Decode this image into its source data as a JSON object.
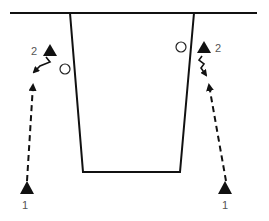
{
  "diagram": {
    "type": "basketball-play-diagram",
    "colors": {
      "line": "#111111",
      "label": "#555555",
      "background": "#ffffff"
    },
    "court": {
      "baseline": {
        "x1": 10,
        "y1": 13,
        "x2": 257,
        "y2": 13
      },
      "lane": {
        "top_left": [
          70,
          13
        ],
        "bottom_left": [
          83,
          172
        ],
        "bottom_right": [
          180,
          172
        ],
        "top_right": [
          194,
          13
        ]
      }
    },
    "players": [
      {
        "id": "left-1",
        "label": "1",
        "marker": "triangle",
        "x": 27,
        "y": 188,
        "label_x": 25,
        "label_y": 208
      },
      {
        "id": "left-2",
        "label": "2",
        "marker": "triangle",
        "x": 50,
        "y": 51,
        "label_x": 33,
        "label_y": 55
      },
      {
        "id": "right-1",
        "label": "1",
        "marker": "triangle",
        "x": 225,
        "y": 188,
        "label_x": 224,
        "label_y": 208
      },
      {
        "id": "right-2",
        "label": "2",
        "marker": "triangle",
        "x": 204,
        "y": 48,
        "label_x": 215,
        "label_y": 52
      }
    ],
    "defenders": [
      {
        "id": "left-defender",
        "marker": "circle",
        "x": 65,
        "y": 69,
        "r": 5
      },
      {
        "id": "right-defender",
        "marker": "circle",
        "x": 181,
        "y": 47,
        "r": 5
      }
    ],
    "paths": [
      {
        "id": "left-1-cut",
        "style": "dashed",
        "from": [
          27,
          181
        ],
        "to": [
          33,
          83
        ]
      },
      {
        "id": "left-2-cut",
        "style": "solid",
        "points": [
          [
            46,
            57
          ],
          [
            50,
            62
          ],
          [
            40,
            66
          ],
          [
            33,
            73
          ]
        ]
      },
      {
        "id": "right-1-cut",
        "style": "dashed",
        "from": [
          226,
          181
        ],
        "to": [
          209,
          83
        ]
      },
      {
        "id": "right-2-cut",
        "style": "squiggle",
        "points": [
          [
            202,
            55
          ],
          [
            199,
            60
          ],
          [
            204,
            64
          ],
          [
            201,
            68
          ],
          [
            207,
            76
          ]
        ]
      }
    ]
  }
}
